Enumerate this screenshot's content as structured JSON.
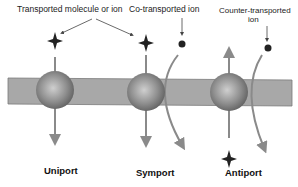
{
  "labels": {
    "transported": "Transported molecule or ion",
    "co_transported": "Co-transported ion",
    "counter_transported_line1": "Counter-transported",
    "counter_transported_line2": "ion"
  },
  "titles": {
    "uniport": "Uniport",
    "symport": "Symport",
    "antiport": "Antiport"
  },
  "colors": {
    "membrane": "#a8a8a8",
    "arrow": "#8a8a8a",
    "sphere": "#888888",
    "molecule": "#222222"
  }
}
